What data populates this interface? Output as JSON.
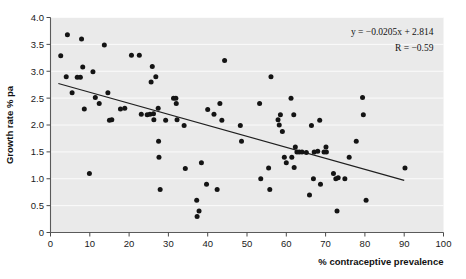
{
  "chart_data": {
    "type": "scatter",
    "title": "",
    "xlabel": "% contraceptive prevalence",
    "ylabel": "Growth rate % pa",
    "xlim": [
      0,
      100
    ],
    "ylim": [
      0,
      4.0
    ],
    "xticks": [
      "0",
      "10",
      "20",
      "30",
      "40",
      "50",
      "60",
      "70",
      "80",
      "90",
      "100"
    ],
    "xtick_values": [
      0,
      10,
      20,
      30,
      40,
      50,
      60,
      70,
      80,
      90,
      100
    ],
    "yticks": [
      "0",
      "0.5",
      "1.0",
      "1.5",
      "2.0",
      "2.5",
      "3.0",
      "3.5",
      "4.0"
    ],
    "ytick_values": [
      0,
      0.5,
      1.0,
      1.5,
      2.0,
      2.5,
      3.0,
      3.5,
      4.0
    ],
    "grid": true,
    "grid_orientation": "horizontal",
    "legend": false,
    "background_color": "#eaeaea",
    "point_color": "#141414",
    "line_color": "#1f1f1f",
    "annotations": [
      {
        "name": "regression-equation",
        "text": "y = −0.0205x + 2.814"
      },
      {
        "name": "correlation-coefficient",
        "text": "R = −0.59"
      }
    ],
    "fit_line": {
      "type": "linear",
      "slope": -0.0205,
      "intercept": 2.814,
      "r": -0.59,
      "x_start": 2,
      "x_end": 90,
      "y_start": 2.773,
      "y_end": 0.969
    },
    "points": [
      [
        2.6,
        3.29
      ],
      [
        4.3,
        3.68
      ],
      [
        4.0,
        2.9
      ],
      [
        5.5,
        2.6
      ],
      [
        6.8,
        2.89
      ],
      [
        7.6,
        2.89
      ],
      [
        7.9,
        3.6
      ],
      [
        8.2,
        3.08
      ],
      [
        8.6,
        2.3
      ],
      [
        9.9,
        1.1
      ],
      [
        10.8,
        2.99
      ],
      [
        11.4,
        2.51
      ],
      [
        12.4,
        2.4
      ],
      [
        13.7,
        3.49
      ],
      [
        14.6,
        2.6
      ],
      [
        15.0,
        2.09
      ],
      [
        15.6,
        2.1
      ],
      [
        17.8,
        2.3
      ],
      [
        18.9,
        2.31
      ],
      [
        20.6,
        3.3
      ],
      [
        22.6,
        3.3
      ],
      [
        23.1,
        2.2
      ],
      [
        24.6,
        2.19
      ],
      [
        25.3,
        2.2
      ],
      [
        25.6,
        2.8
      ],
      [
        25.9,
        3.09
      ],
      [
        26.2,
        2.21
      ],
      [
        26.3,
        2.1
      ],
      [
        26.8,
        2.9
      ],
      [
        27.4,
        2.31
      ],
      [
        27.5,
        1.7
      ],
      [
        27.6,
        1.4
      ],
      [
        27.9,
        0.8
      ],
      [
        29.3,
        2.09
      ],
      [
        31.3,
        2.5
      ],
      [
        31.9,
        2.5
      ],
      [
        32.0,
        2.4
      ],
      [
        32.2,
        2.1
      ],
      [
        34.0,
        1.99
      ],
      [
        34.3,
        1.19
      ],
      [
        37.2,
        0.6
      ],
      [
        37.3,
        0.3
      ],
      [
        37.8,
        0.4
      ],
      [
        38.4,
        1.3
      ],
      [
        39.7,
        0.9
      ],
      [
        40.0,
        2.29
      ],
      [
        41.6,
        2.2
      ],
      [
        42.4,
        0.8
      ],
      [
        43.1,
        2.4
      ],
      [
        43.6,
        2.09
      ],
      [
        44.3,
        3.2
      ],
      [
        48.3,
        1.99
      ],
      [
        48.6,
        1.7
      ],
      [
        53.2,
        2.4
      ],
      [
        53.5,
        1.0
      ],
      [
        55.5,
        1.2
      ],
      [
        55.8,
        0.8
      ],
      [
        56.1,
        2.9
      ],
      [
        57.9,
        2.1
      ],
      [
        58.2,
        2.0
      ],
      [
        58.5,
        2.19
      ],
      [
        59.0,
        1.88
      ],
      [
        59.5,
        1.4
      ],
      [
        60.0,
        1.3
      ],
      [
        61.2,
        2.5
      ],
      [
        61.4,
        1.4
      ],
      [
        61.9,
        2.19
      ],
      [
        62.0,
        1.21
      ],
      [
        62.3,
        1.59
      ],
      [
        62.7,
        1.5
      ],
      [
        63.3,
        1.5
      ],
      [
        64.0,
        1.5
      ],
      [
        65.1,
        1.49
      ],
      [
        65.9,
        0.7
      ],
      [
        66.4,
        1.99
      ],
      [
        66.9,
        1.0
      ],
      [
        67.1,
        1.5
      ],
      [
        68.0,
        1.51
      ],
      [
        68.5,
        2.09
      ],
      [
        68.7,
        0.9
      ],
      [
        69.6,
        1.5
      ],
      [
        70.1,
        1.59
      ],
      [
        70.2,
        1.5
      ],
      [
        72.0,
        1.1
      ],
      [
        72.6,
        1.0
      ],
      [
        72.9,
        0.4
      ],
      [
        73.2,
        1.02
      ],
      [
        74.9,
        1.0
      ],
      [
        76.0,
        1.4
      ],
      [
        77.8,
        1.7
      ],
      [
        79.4,
        2.51
      ],
      [
        79.6,
        2.19
      ],
      [
        80.3,
        0.6
      ],
      [
        90.2,
        1.2
      ]
    ]
  }
}
